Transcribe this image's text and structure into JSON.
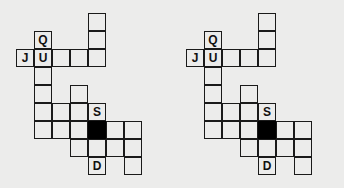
{
  "canvas": {
    "width": 344,
    "height": 188,
    "background_color": "#ececeb",
    "grid_line_color": "#1a1a1a",
    "blocked_cell_color": "#000000",
    "letter_color": "#111111",
    "cell_size": 18
  },
  "puzzles": [
    {
      "name": "crossword-grid-left",
      "origin_x": 0,
      "origin_y": 0,
      "cells": [
        {
          "col": 4,
          "row": 0,
          "letter": "",
          "blocked": false
        },
        {
          "col": 4,
          "row": 1,
          "letter": "",
          "blocked": false
        },
        {
          "col": 1,
          "row": 1,
          "letter": "Q",
          "blocked": false
        },
        {
          "col": 0,
          "row": 2,
          "letter": "J",
          "blocked": false
        },
        {
          "col": 1,
          "row": 2,
          "letter": "U",
          "blocked": false
        },
        {
          "col": 2,
          "row": 2,
          "letter": "",
          "blocked": false
        },
        {
          "col": 3,
          "row": 2,
          "letter": "",
          "blocked": false
        },
        {
          "col": 4,
          "row": 2,
          "letter": "",
          "blocked": false
        },
        {
          "col": 1,
          "row": 3,
          "letter": "",
          "blocked": false
        },
        {
          "col": 1,
          "row": 4,
          "letter": "",
          "blocked": false
        },
        {
          "col": 1,
          "row": 5,
          "letter": "",
          "blocked": false
        },
        {
          "col": 1,
          "row": 6,
          "letter": "",
          "blocked": false
        },
        {
          "col": 3,
          "row": 4,
          "letter": "",
          "blocked": false
        },
        {
          "col": 2,
          "row": 5,
          "letter": "",
          "blocked": false
        },
        {
          "col": 3,
          "row": 5,
          "letter": "",
          "blocked": false
        },
        {
          "col": 4,
          "row": 5,
          "letter": "S",
          "blocked": false
        },
        {
          "col": 2,
          "row": 6,
          "letter": "",
          "blocked": false
        },
        {
          "col": 3,
          "row": 6,
          "letter": "",
          "blocked": false
        },
        {
          "col": 4,
          "row": 6,
          "letter": "",
          "blocked": true
        },
        {
          "col": 5,
          "row": 6,
          "letter": "",
          "blocked": false
        },
        {
          "col": 6,
          "row": 6,
          "letter": "",
          "blocked": false
        },
        {
          "col": 3,
          "row": 7,
          "letter": "",
          "blocked": false
        },
        {
          "col": 4,
          "row": 7,
          "letter": "",
          "blocked": false
        },
        {
          "col": 5,
          "row": 7,
          "letter": "",
          "blocked": false
        },
        {
          "col": 6,
          "row": 7,
          "letter": "",
          "blocked": false
        },
        {
          "col": 4,
          "row": 8,
          "letter": "D",
          "blocked": false
        },
        {
          "col": 6,
          "row": 8,
          "letter": "",
          "blocked": false
        }
      ]
    },
    {
      "name": "crossword-grid-right",
      "origin_x": 170,
      "origin_y": 0,
      "cells": [
        {
          "col": 4,
          "row": 0,
          "letter": "",
          "blocked": false
        },
        {
          "col": 4,
          "row": 1,
          "letter": "",
          "blocked": false
        },
        {
          "col": 1,
          "row": 1,
          "letter": "Q",
          "blocked": false
        },
        {
          "col": 0,
          "row": 2,
          "letter": "J",
          "blocked": false
        },
        {
          "col": 1,
          "row": 2,
          "letter": "U",
          "blocked": false
        },
        {
          "col": 2,
          "row": 2,
          "letter": "",
          "blocked": false
        },
        {
          "col": 3,
          "row": 2,
          "letter": "",
          "blocked": false
        },
        {
          "col": 4,
          "row": 2,
          "letter": "",
          "blocked": false
        },
        {
          "col": 1,
          "row": 3,
          "letter": "",
          "blocked": false
        },
        {
          "col": 1,
          "row": 4,
          "letter": "",
          "blocked": false
        },
        {
          "col": 1,
          "row": 5,
          "letter": "",
          "blocked": false
        },
        {
          "col": 1,
          "row": 6,
          "letter": "",
          "blocked": false
        },
        {
          "col": 3,
          "row": 4,
          "letter": "",
          "blocked": false
        },
        {
          "col": 2,
          "row": 5,
          "letter": "",
          "blocked": false
        },
        {
          "col": 3,
          "row": 5,
          "letter": "",
          "blocked": false
        },
        {
          "col": 4,
          "row": 5,
          "letter": "S",
          "blocked": false
        },
        {
          "col": 2,
          "row": 6,
          "letter": "",
          "blocked": false
        },
        {
          "col": 3,
          "row": 6,
          "letter": "",
          "blocked": false
        },
        {
          "col": 4,
          "row": 6,
          "letter": "",
          "blocked": true
        },
        {
          "col": 5,
          "row": 6,
          "letter": "",
          "blocked": false
        },
        {
          "col": 6,
          "row": 6,
          "letter": "",
          "blocked": false
        },
        {
          "col": 3,
          "row": 7,
          "letter": "",
          "blocked": false
        },
        {
          "col": 4,
          "row": 7,
          "letter": "",
          "blocked": false
        },
        {
          "col": 5,
          "row": 7,
          "letter": "",
          "blocked": false
        },
        {
          "col": 6,
          "row": 7,
          "letter": "",
          "blocked": false
        },
        {
          "col": 4,
          "row": 8,
          "letter": "D",
          "blocked": false
        },
        {
          "col": 6,
          "row": 8,
          "letter": "",
          "blocked": false
        }
      ]
    }
  ]
}
